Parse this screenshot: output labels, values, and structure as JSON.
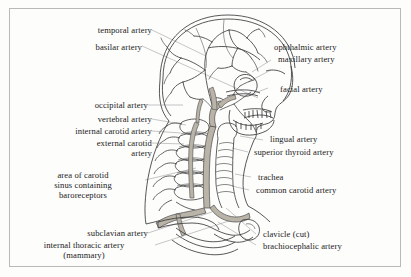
{
  "figure": {
    "border_color": "#b9b9b9",
    "background_color": "#fdfdfc",
    "ink_color": "#3a3a3a",
    "vessel_fill": "#b9b3a8",
    "leader_color": "#9a9a9a"
  },
  "labels_left": [
    {
      "id": "temporal-artery",
      "text": "temporal artery"
    },
    {
      "id": "basilar-artery",
      "text": "basilar artery"
    },
    {
      "id": "occipital-artery",
      "text": "occipital artery"
    },
    {
      "id": "vertebral-artery",
      "text": "vertebral artery"
    },
    {
      "id": "internal-carotid-artery",
      "text": "internal carotid artery"
    },
    {
      "id": "external-carotid-artery",
      "text": "external carotid\nartery"
    },
    {
      "id": "carotid-sinus",
      "text": "area of carotid\nsinus containing\nbaroreceptors"
    },
    {
      "id": "subclavian-artery",
      "text": "subclavian artery"
    },
    {
      "id": "internal-thoracic-artery",
      "text": "internal thoracic artery\n(mammary)"
    }
  ],
  "labels_right": [
    {
      "id": "ophthalmic-artery",
      "text": "ophthalmic artery"
    },
    {
      "id": "maxillary-artery",
      "text": "maxillary artery"
    },
    {
      "id": "facial-artery",
      "text": "facial artery"
    },
    {
      "id": "lingual-artery",
      "text": "lingual artery"
    },
    {
      "id": "superior-thyroid-artery",
      "text": "superior thyroid artery"
    },
    {
      "id": "trachea",
      "text": "trachea"
    },
    {
      "id": "common-carotid-artery",
      "text": "common carotid artery"
    },
    {
      "id": "clavicle-cut",
      "text": "clavicle (cut)"
    },
    {
      "id": "brachiocephalic-artery",
      "text": "brachiocephalic artery"
    }
  ]
}
